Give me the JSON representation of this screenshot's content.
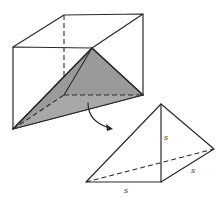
{
  "diagram": {
    "type": "geometry",
    "colors": {
      "stroke": "#2a2a2a",
      "shade": "#9a9a9a",
      "background": "#ffffff"
    },
    "labels": {
      "vertical_edge": "s",
      "bottom_edge": "s",
      "slant_edge": "s"
    }
  }
}
